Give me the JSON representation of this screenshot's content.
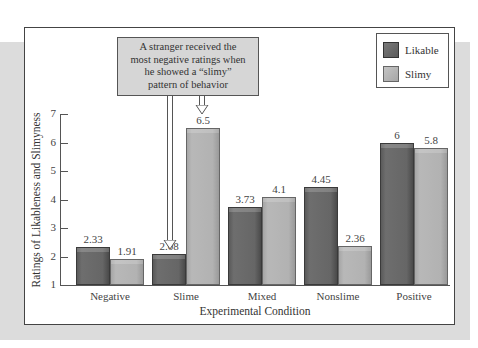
{
  "chart_data": {
    "type": "bar",
    "title": "",
    "xlabel": "Experimental Condition",
    "ylabel": "Ratings of Likableness and Slimyness",
    "ylim": [
      1,
      7
    ],
    "yticks": [
      1,
      2,
      3,
      4,
      5,
      6,
      7
    ],
    "grid": false,
    "legend_position": "top-right",
    "categories": [
      "Negative",
      "Slime",
      "Mixed",
      "Nonslime",
      "Positive"
    ],
    "series": [
      {
        "name": "Likable",
        "color": "#666666",
        "values": [
          2.33,
          2.08,
          3.73,
          4.45,
          6
        ]
      },
      {
        "name": "Slimy",
        "color": "#b2b2b2",
        "values": [
          1.91,
          6.5,
          4.1,
          2.36,
          5.8
        ]
      }
    ],
    "value_labels": {
      "Likable": [
        "2.33",
        "2.08",
        "3.73",
        "4.45",
        "6"
      ],
      "Slimy": [
        "1.91",
        "6.5",
        "4.1",
        "2.36",
        "5.8"
      ]
    },
    "annotation": {
      "lines": [
        "A stranger received the",
        "most negative ratings when",
        "he showed a “slimy”",
        "pattern of behavior"
      ],
      "points_to": [
        "Slime / Likable",
        "Slime / Slimy"
      ]
    }
  },
  "legend": {
    "items": [
      {
        "label": "Likable",
        "color": "#666666"
      },
      {
        "label": "Slimy",
        "color": "#b2b2b2"
      }
    ]
  },
  "axes": {
    "y_ticks": [
      "1",
      "2",
      "3",
      "4",
      "5",
      "6",
      "7"
    ],
    "x_title": "Experimental Condition",
    "y_title": "Ratings of Likableness and Slimyness"
  }
}
